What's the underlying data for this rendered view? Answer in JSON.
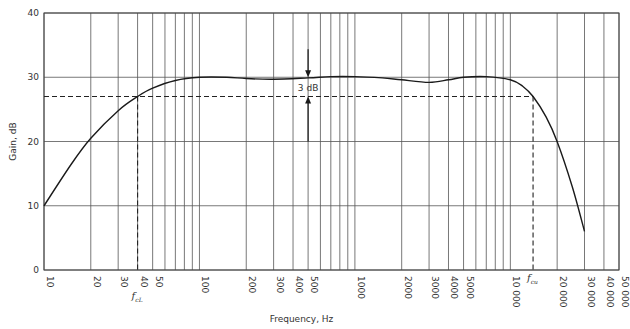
{
  "chart_data": {
    "type": "line",
    "title": "",
    "xlabel": "Frequency, Hz",
    "ylabel": "Gain, dB",
    "x_scale": "log",
    "xlim": [
      10,
      50000
    ],
    "ylim": [
      0,
      40
    ],
    "grid": true,
    "legend": null,
    "y_ticks": [
      0,
      10,
      20,
      30,
      40
    ],
    "x_ticks": [
      {
        "value": 10,
        "label": "10"
      },
      {
        "value": 20,
        "label": "20"
      },
      {
        "value": 30,
        "label": "30"
      },
      {
        "value": 40,
        "label": "40"
      },
      {
        "value": 50,
        "label": "50"
      },
      {
        "value": 100,
        "label": "100"
      },
      {
        "value": 200,
        "label": "200"
      },
      {
        "value": 300,
        "label": "300"
      },
      {
        "value": 400,
        "label": "400"
      },
      {
        "value": 500,
        "label": "500"
      },
      {
        "value": 1000,
        "label": "1000"
      },
      {
        "value": 2000,
        "label": "2000"
      },
      {
        "value": 3000,
        "label": "3000"
      },
      {
        "value": 4000,
        "label": "4000"
      },
      {
        "value": 5000,
        "label": "5000"
      },
      {
        "value": 10000,
        "label": "10 000"
      },
      {
        "value": 20000,
        "label": "20 000"
      },
      {
        "value": 30000,
        "label": "30 000"
      },
      {
        "value": 40000,
        "label": "40 000"
      },
      {
        "value": 50000,
        "label": "50 000"
      }
    ],
    "minor_x_gridlines": [
      60,
      70,
      80,
      90,
      600,
      700,
      800,
      900,
      6000,
      7000,
      8000,
      9000
    ],
    "series": [
      {
        "name": "Gain response",
        "x": [
          10,
          15,
          20,
          30,
          40,
          50,
          70,
          100,
          150,
          200,
          300,
          500,
          700,
          1000,
          1500,
          2000,
          3000,
          4000,
          5000,
          7000,
          10000,
          12000,
          14000,
          17000,
          20000,
          25000,
          30000
        ],
        "values": [
          10,
          16.5,
          20.5,
          24.8,
          27,
          28.3,
          29.5,
          30,
          30,
          29.8,
          29.7,
          29.9,
          30.1,
          30.1,
          29.9,
          29.6,
          29.2,
          29.6,
          30,
          30.1,
          29.6,
          28.6,
          27,
          23.8,
          20,
          13,
          6
        ]
      }
    ],
    "annotations": [
      {
        "type": "dashed_hline",
        "y": 27,
        "x_from": 10,
        "x_to": 14000
      },
      {
        "type": "dashed_vline",
        "x": 40,
        "y_from": 0,
        "y_to": 27,
        "label": "f_cL"
      },
      {
        "type": "dashed_vline",
        "x": 14000,
        "y_from": 0,
        "y_to": 27,
        "label": "f_cu"
      },
      {
        "type": "dimension_arrow",
        "x": 500,
        "from_y": 30,
        "to_y": 27,
        "label": "3 dB"
      }
    ]
  },
  "labels": {
    "y_axis_title": "Gain, dB",
    "x_axis_title": "Frequency, Hz",
    "delta_label": "3 dB",
    "fc_lower_main": "f",
    "fc_lower_sub": "cL",
    "fc_upper_main": "f",
    "fc_upper_sub": "cu"
  }
}
